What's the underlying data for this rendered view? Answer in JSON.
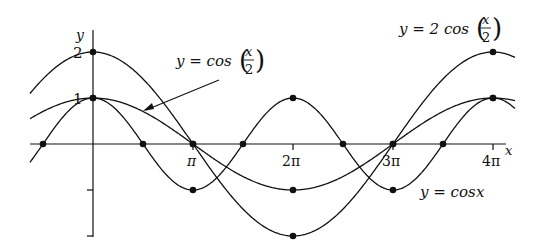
{
  "chart_data": {
    "type": "line",
    "title": "",
    "xlabel": "x",
    "ylabel": "y",
    "xlim": [
      -0.63,
      4.0
    ],
    "xlim_units": "multiples of pi",
    "ylim": [
      -2,
      2
    ],
    "grid": false,
    "x_ticks": [
      {
        "value": 1,
        "label": "π"
      },
      {
        "value": 2,
        "label": "2π"
      },
      {
        "value": 3,
        "label": "3π"
      },
      {
        "value": 4,
        "label": "4π"
      }
    ],
    "y_ticks": [
      {
        "value": 2,
        "label": "2"
      },
      {
        "value": 1,
        "label": "1"
      },
      {
        "value": -1,
        "label": ""
      },
      {
        "value": -2,
        "label": ""
      }
    ],
    "series": [
      {
        "name": "y = cos x",
        "label_prefix": "y = cos x",
        "formula": "cos(x)",
        "amplitude": 1,
        "frequency": 1,
        "marked_points": [
          [
            -0.5,
            0
          ],
          [
            0,
            1
          ],
          [
            0.5,
            0
          ],
          [
            1,
            -1
          ],
          [
            1.5,
            0
          ],
          [
            2,
            1
          ],
          [
            2.5,
            0
          ],
          [
            3,
            -1
          ],
          [
            3.5,
            0
          ],
          [
            4,
            1
          ]
        ]
      },
      {
        "name": "y = cos(x/2)",
        "label_prefix": "y = cos",
        "formula": "cos(x/2)",
        "amplitude": 1,
        "frequency": 0.5,
        "marked_points": [
          [
            0,
            1
          ],
          [
            1,
            0
          ],
          [
            2,
            -1
          ],
          [
            3,
            0
          ],
          [
            4,
            1
          ]
        ]
      },
      {
        "name": "y = 2 cos(x/2)",
        "label_prefix": "y = 2 cos",
        "formula": "2cos(x/2)",
        "amplitude": 2,
        "frequency": 0.5,
        "marked_points": [
          [
            0,
            2
          ],
          [
            1,
            0
          ],
          [
            2,
            -2
          ],
          [
            3,
            0
          ],
          [
            4,
            2
          ]
        ]
      }
    ],
    "annotations": [
      {
        "text": "y = cos(x/2)",
        "arrow_to": "cos(x/2) curve near x≈0.4π"
      },
      {
        "text": "y = 2 cos(x/2)",
        "position": "top right"
      },
      {
        "text": "y = cos x",
        "position": "lower right"
      }
    ]
  },
  "labels": {
    "y_axis": "y",
    "x_axis": "x",
    "tick_pi": "π",
    "tick_2pi": "2π",
    "tick_3pi": "3π",
    "tick_4pi": "4π",
    "ytick_2": "2",
    "ytick_1": "1",
    "label_cosx_half": "y = cos",
    "label_2cosx_half": "y = 2 cos",
    "label_cosx": "y = cos",
    "frac_num": "x",
    "frac_den": "2",
    "var_x": "x"
  }
}
